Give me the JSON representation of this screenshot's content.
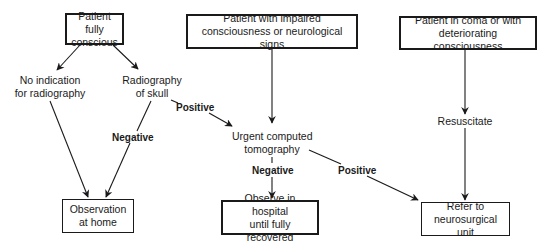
{
  "nodes": {
    "fully_conscious": "Patient fully conscious",
    "fully_conscious_l1": "Patient fully",
    "fully_conscious_l2": "conscious",
    "impaired_l1": "Patient with impaired",
    "impaired_l2": "consciousness or neurological signs",
    "coma_l1": "Patient in coma or with",
    "coma_l2": "deteriorating consciousness",
    "no_indication_l1": "No indication",
    "no_indication_l2": "for radiography",
    "radiography_l1": "Radiography",
    "radiography_l2": "of skull",
    "urgent_ct_l1": "Urgent computed",
    "urgent_ct_l2": "tomography",
    "resuscitate": "Resuscitate",
    "observe_home_l1": "Observation",
    "observe_home_l2": "at home",
    "observe_hospital_l1": "Observe in hospital",
    "observe_hospital_l2": "until fully recovered",
    "refer_l1": "Refer to",
    "refer_l2": "neurosurgical unit"
  },
  "edge_labels": {
    "xray_positive": "Positive",
    "xray_negative": "Negative",
    "ct_negative": "Negative",
    "ct_positive": "Positive"
  },
  "colors": {
    "stroke": "#1a1a1a",
    "background": "#ffffff"
  }
}
